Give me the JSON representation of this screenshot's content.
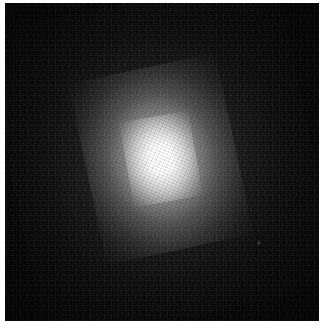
{
  "figure": {
    "kind": "astronomical-grayscale-image",
    "colormap": "grayscale",
    "background_color": "#030303",
    "core_color": "#ffffff",
    "frame_color": "#ffffff",
    "alt_text": ""
  },
  "plate": {
    "width_px": 314,
    "height_px": 318,
    "offset_left_px": 5,
    "offset_top_px": 3
  },
  "source_object": {
    "center_x_px": 161,
    "center_y_px": 159,
    "core_radius_px": 13,
    "inner_bulge_radius_px": 40,
    "halo_radius_px": 92,
    "position_angle_deg": -12,
    "axis_ratio": 0.82
  },
  "field_stars": [
    {
      "name": "faint-point-source",
      "x_px": 259,
      "y_px": 243,
      "brightness": 0.55
    }
  ],
  "labels": {
    "title": "",
    "scale_bar": "",
    "north_arrow": "",
    "east_arrow": ""
  }
}
